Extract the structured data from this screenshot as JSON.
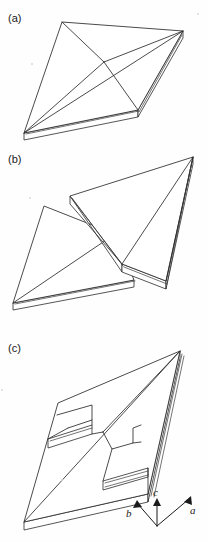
{
  "figure": {
    "background_color": "#fefefe",
    "line_color": "#2b2b2b",
    "panels": [
      {
        "id": "a",
        "label": "(a)",
        "caption_text": "(a)",
        "description": "Intact rhombic plate with pyramidal diagonals meeting at a central apex"
      },
      {
        "id": "b",
        "label": "(b)",
        "caption_text": "(b)",
        "description": "Plate cleaved into two separated triangular halves"
      },
      {
        "id": "c",
        "label": "(c)",
        "caption_text": "(c)",
        "description": "Plate with two stepped rectangular notches cut into the surface"
      }
    ]
  },
  "axes": {
    "name": "crystallographic-axis-triad",
    "origin_label": "",
    "arrows": [
      {
        "id": "b",
        "label": "b",
        "direction": "upper-left"
      },
      {
        "id": "c",
        "label": "c",
        "direction": "up"
      },
      {
        "id": "a",
        "label": "a",
        "direction": "upper-right"
      }
    ]
  }
}
